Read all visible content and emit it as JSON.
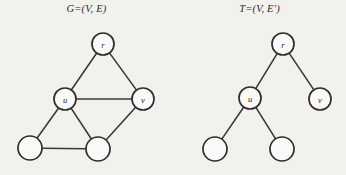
{
  "figure": {
    "background_color": "#f2f1ee",
    "ink_color": "#2e2e2e",
    "node_fill_color": "#faf9f7"
  },
  "panels": [
    {
      "id": "graph",
      "caption": "G=(V, E)",
      "kind": "undirected-graph"
    },
    {
      "id": "tree",
      "caption": "T=(V, E')",
      "kind": "spanning-tree"
    }
  ],
  "graph": {
    "caption": "G=(V, E)",
    "nodes": [
      {
        "id": "g-r",
        "label": "r",
        "cx": 103,
        "cy": 44,
        "r": 11
      },
      {
        "id": "g-u",
        "label": "u",
        "cx": 65,
        "cy": 99,
        "r": 11
      },
      {
        "id": "g-v",
        "label": "v",
        "cx": 143,
        "cy": 99,
        "r": 11
      },
      {
        "id": "g-bl",
        "label": "",
        "cx": 30,
        "cy": 148,
        "r": 12
      },
      {
        "id": "g-bm",
        "label": "",
        "cx": 98,
        "cy": 149,
        "r": 12
      }
    ],
    "edges": [
      {
        "from": "g-r",
        "to": "g-u"
      },
      {
        "from": "g-r",
        "to": "g-v"
      },
      {
        "from": "g-u",
        "to": "g-v"
      },
      {
        "from": "g-u",
        "to": "g-bl"
      },
      {
        "from": "g-u",
        "to": "g-bm"
      },
      {
        "from": "g-v",
        "to": "g-bm"
      },
      {
        "from": "g-bl",
        "to": "g-bm"
      }
    ]
  },
  "tree": {
    "caption": "T=(V, E')",
    "nodes": [
      {
        "id": "t-r",
        "label": "r",
        "cx": 283,
        "cy": 44,
        "r": 11
      },
      {
        "id": "t-u",
        "label": "u",
        "cx": 250,
        "cy": 98,
        "r": 11
      },
      {
        "id": "t-v",
        "label": "v",
        "cx": 320,
        "cy": 99,
        "r": 11
      },
      {
        "id": "t-bl",
        "label": "",
        "cx": 215,
        "cy": 149,
        "r": 12
      },
      {
        "id": "t-bm",
        "label": "",
        "cx": 282,
        "cy": 149,
        "r": 12
      }
    ],
    "edges": [
      {
        "from": "t-r",
        "to": "t-u"
      },
      {
        "from": "t-r",
        "to": "t-v"
      },
      {
        "from": "t-u",
        "to": "t-bl"
      },
      {
        "from": "t-u",
        "to": "t-bm"
      }
    ]
  }
}
